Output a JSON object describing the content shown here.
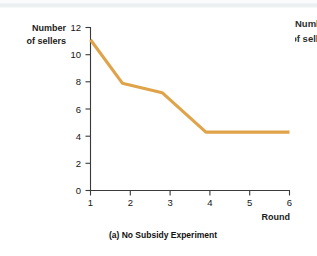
{
  "figure": {
    "caption": "(a) No Subsidy Experiment",
    "neighbor_panel": {
      "line1": "Number",
      "line2": "of sellers"
    }
  },
  "axes": {
    "ylabel_line1": "Number",
    "ylabel_line2": "of sellers",
    "xlabel": "Round",
    "yticks": [
      "0",
      "2",
      "4",
      "6",
      "8",
      "10",
      "12"
    ],
    "xticks": [
      "1",
      "2",
      "3",
      "4",
      "5",
      "6"
    ]
  },
  "colors": {
    "line": "#dfa349",
    "axis": "#3a3a3a",
    "text": "#161616",
    "background": "#ffffff"
  },
  "chart_data": {
    "type": "line",
    "title": "(a) No Subsidy Experiment",
    "xlabel": "Round",
    "ylabel": "Number of sellers",
    "xlim": [
      1,
      6
    ],
    "ylim": [
      0,
      12
    ],
    "xticks": [
      1,
      2,
      3,
      4,
      5,
      6
    ],
    "yticks": [
      0,
      2,
      4,
      6,
      8,
      10,
      12
    ],
    "grid": false,
    "legend": "none",
    "series": [
      {
        "name": "Number of sellers",
        "color": "#dfa349",
        "x": [
          1,
          1.8,
          2.8,
          3.9,
          6
        ],
        "y": [
          11.1,
          7.9,
          7.2,
          4.3,
          4.3
        ]
      }
    ]
  }
}
